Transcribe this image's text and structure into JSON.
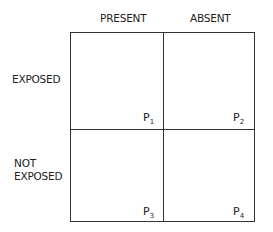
{
  "columns": [
    "PRESENT",
    "ABSENT"
  ],
  "rows": [
    {
      "line1": "EXPOSED"
    },
    {
      "line1": "NOT",
      "line2": "EXPOSED"
    }
  ],
  "cells": [
    {
      "p": "P",
      "sub": "1"
    },
    {
      "p": "P",
      "sub": "2"
    },
    {
      "p": "P",
      "sub": "3"
    },
    {
      "p": "P",
      "sub": "4"
    }
  ]
}
